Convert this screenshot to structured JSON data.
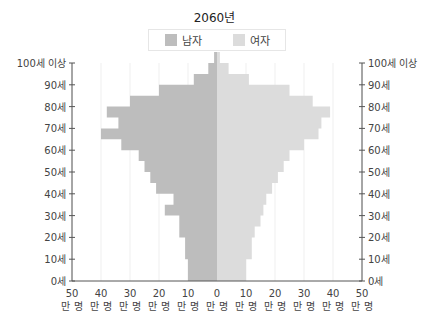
{
  "title": "2060년",
  "legend": [
    {
      "label": "남자",
      "color": "#bdbdbd"
    },
    {
      "label": "여자",
      "color": "#dcdcdc"
    }
  ],
  "y_axis_labels": [
    "0세",
    "10세",
    "20세",
    "30세",
    "40세",
    "50세",
    "60세",
    "70세",
    "80세",
    "90세",
    "100세 이상"
  ],
  "x_axis_labels": [
    {
      "num": "50",
      "unit": "만 명"
    },
    {
      "num": "40",
      "unit": "만 명"
    },
    {
      "num": "30",
      "unit": "만 명"
    },
    {
      "num": "20",
      "unit": "만 명"
    },
    {
      "num": "10",
      "unit": "만 명"
    },
    {
      "num": "0",
      "unit": "만 명"
    },
    {
      "num": "10",
      "unit": "만 명"
    },
    {
      "num": "20",
      "unit": "만 명"
    },
    {
      "num": "30",
      "unit": "만 명"
    },
    {
      "num": "40",
      "unit": "만 명"
    },
    {
      "num": "50",
      "unit": "만 명"
    }
  ],
  "chart_data": {
    "type": "bar",
    "orientation": "horizontal-pyramid",
    "title": "2060년",
    "xlabel": "인구 (만 명)",
    "ylabel": "연령",
    "xlim": [
      -50,
      50
    ],
    "grid": true,
    "legend_position": "top",
    "categories": [
      "0-4세",
      "5-9세",
      "10-14세",
      "15-19세",
      "20-24세",
      "25-29세",
      "30-34세",
      "35-39세",
      "40-44세",
      "45-49세",
      "50-54세",
      "55-59세",
      "60-64세",
      "65-69세",
      "70-74세",
      "75-79세",
      "80-84세",
      "85-89세",
      "90-94세",
      "95-99세",
      "100세 이상"
    ],
    "series": [
      {
        "name": "남자",
        "color": "#bdbdbd",
        "values": [
          10,
          10,
          11,
          11,
          13,
          13,
          18,
          15,
          21,
          23,
          25,
          27,
          33,
          40,
          34,
          38,
          30,
          20,
          8,
          3,
          1
        ]
      },
      {
        "name": "여자",
        "color": "#dcdcdc",
        "values": [
          10,
          10,
          12,
          12,
          13,
          15,
          16,
          17,
          19,
          21,
          23,
          25,
          30,
          35,
          36,
          39,
          33,
          25,
          11,
          4,
          1
        ]
      }
    ]
  }
}
